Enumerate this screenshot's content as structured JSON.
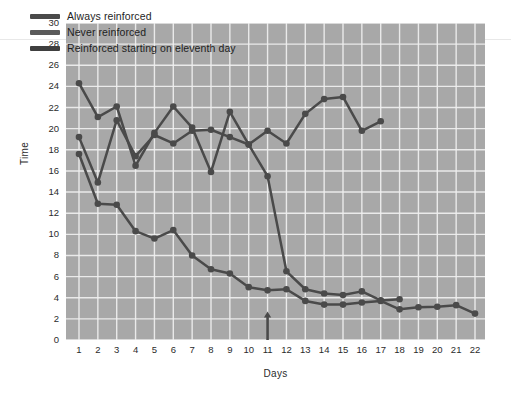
{
  "chart_data": {
    "type": "line",
    "title": "",
    "xlabel": "Days",
    "ylabel": "Time",
    "xlim": [
      1,
      22
    ],
    "ylim": [
      0,
      30
    ],
    "ytick_step": 2,
    "xticks": [
      1,
      2,
      3,
      4,
      5,
      6,
      7,
      8,
      9,
      10,
      11,
      12,
      13,
      14,
      15,
      16,
      17,
      18,
      19,
      20,
      21,
      22
    ],
    "yticks": [
      0,
      2,
      4,
      6,
      8,
      10,
      12,
      14,
      16,
      18,
      20,
      22,
      24,
      26,
      28,
      30
    ],
    "grid": true,
    "plot_background": "#a8a8a8",
    "grid_color": "#f0f0f0",
    "legend_position": "top-left",
    "markers": "filled-circle",
    "annotations": [
      {
        "name": "eleventh-day-arrow",
        "type": "up-arrow",
        "x": 11,
        "y_from": 0,
        "y_to": 2.7,
        "color": "#4a4a4a"
      }
    ],
    "series": [
      {
        "name": "Always reinforced",
        "color": "#4a4a4a",
        "x": [
          1,
          2,
          3,
          4,
          5,
          6,
          7,
          8,
          9,
          10,
          11,
          12,
          13,
          14,
          15,
          16,
          17,
          18,
          19,
          20,
          21,
          22
        ],
        "values": [
          17.6,
          12.9,
          12.8,
          10.3,
          9.6,
          10.4,
          8.0,
          6.7,
          6.3,
          5.0,
          4.7,
          4.8,
          3.7,
          3.35,
          3.35,
          3.55,
          3.7,
          2.9,
          3.1,
          3.15,
          3.3,
          2.5
        ]
      },
      {
        "name": "Never reinforced",
        "color": "#4a4a4a",
        "x": [
          1,
          2,
          3,
          4,
          5,
          6,
          7,
          8,
          9,
          10,
          11,
          12,
          13,
          14,
          15,
          16,
          17
        ],
        "values": [
          24.3,
          21.1,
          22.1,
          16.5,
          19.6,
          22.1,
          20.1,
          15.9,
          21.6,
          18.5,
          19.8,
          18.6,
          21.4,
          22.8,
          23.0,
          19.8,
          20.7
        ]
      },
      {
        "name": "Reinforced starting on eleventh day",
        "color": "#4a4a4a",
        "x": [
          1,
          2,
          3,
          4,
          5,
          6,
          7,
          8,
          9,
          10,
          11,
          12,
          13,
          14,
          15,
          16,
          17,
          18
        ],
        "values": [
          19.2,
          14.9,
          20.8,
          17.4,
          19.4,
          18.6,
          19.8,
          19.9,
          19.2,
          18.5,
          15.5,
          6.5,
          4.8,
          4.4,
          4.25,
          4.6,
          3.75,
          3.85
        ]
      }
    ]
  },
  "legend": {
    "items": [
      {
        "label": "Always reinforced",
        "color": "#4a4a4a"
      },
      {
        "label": "Never reinforced",
        "color": "#5a5a5a"
      },
      {
        "label": "Reinforced starting on eleventh day",
        "color": "#3f3f3f"
      }
    ]
  },
  "axes": {
    "x_title": "Days",
    "y_title": "Time"
  }
}
